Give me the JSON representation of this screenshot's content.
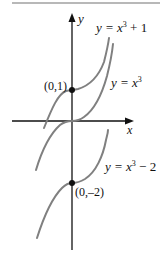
{
  "figure": {
    "type": "function-graph",
    "axes": {
      "x_label": "x",
      "y_label": "y"
    },
    "curves": [
      {
        "id": "cubic-plus-1",
        "label_prefix": "y = x",
        "label_exp": "3",
        "label_suffix": " + 1",
        "shift": 1
      },
      {
        "id": "cubic",
        "label_prefix": "y = x",
        "label_exp": "3",
        "label_suffix": "",
        "shift": 0
      },
      {
        "id": "cubic-minus-2",
        "label_prefix": "y = x",
        "label_exp": "3",
        "label_suffix": " − 2",
        "shift": -2
      }
    ],
    "points": [
      {
        "label": "(0,1)",
        "x": 0,
        "y": 1
      },
      {
        "label": "(0,–2)",
        "x": 0,
        "y": -2
      }
    ],
    "colors": {
      "axis": "#111111",
      "curve": "#808080",
      "point": "#111111",
      "rule": "#b8b8b8"
    }
  }
}
